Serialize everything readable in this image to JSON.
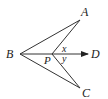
{
  "diagram": {
    "type": "geometry",
    "stroke_color": "#333333",
    "points": {
      "A": {
        "label": "A",
        "x": 80,
        "y": 20
      },
      "B": {
        "label": "B",
        "x": 20,
        "y": 54
      },
      "C": {
        "label": "C",
        "x": 80,
        "y": 88
      },
      "P": {
        "label": "P",
        "x": 52,
        "y": 54
      },
      "D": {
        "label": "D",
        "x": 88,
        "y": 54
      }
    },
    "segments": [
      "BA",
      "BC",
      "PA",
      "PC",
      "BP"
    ],
    "rays": [
      {
        "from": "P",
        "to": "D",
        "arrow": true
      }
    ],
    "angles": {
      "x": {
        "label": "x",
        "between": [
          "PA",
          "PD"
        ]
      },
      "y": {
        "label": "y",
        "between": [
          "PD",
          "PC"
        ]
      }
    }
  }
}
